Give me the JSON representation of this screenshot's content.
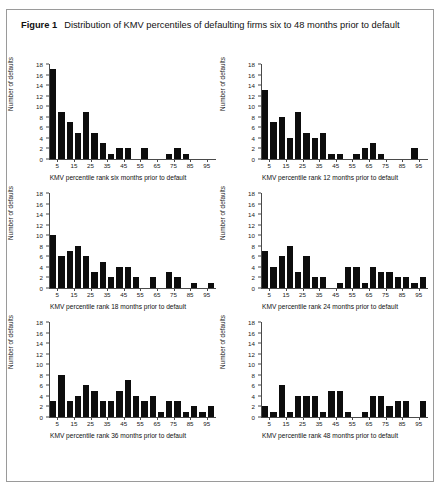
{
  "figure": {
    "label": "Figure 1",
    "title": "Distribution of KMV percentiles of defaulting firms six to 48 months prior to default"
  },
  "axis": {
    "ylabel": "Number of defaults",
    "yticks": [
      "0",
      "2",
      "4",
      "6",
      "8",
      "10",
      "12",
      "14",
      "16",
      "18"
    ],
    "xticks": [
      "5",
      "15",
      "25",
      "35",
      "45",
      "55",
      "65",
      "75",
      "85",
      "95"
    ]
  },
  "colors": {
    "bar": "#0d0d0d",
    "axis": "#4a4a4a",
    "border": "#9a9a9a",
    "background": "#ffffff"
  },
  "chart_data": [
    {
      "type": "bar",
      "title": "",
      "xlabel": "KMV percentile rank six months prior to default",
      "ylabel": "Number of defaults",
      "categories": [
        5,
        10,
        15,
        20,
        25,
        30,
        35,
        40,
        45,
        50,
        55,
        60,
        65,
        70,
        75,
        80,
        85,
        90,
        95,
        100
      ],
      "values": [
        17,
        9,
        7,
        5,
        9,
        5,
        3,
        1,
        2,
        2,
        0,
        2,
        0,
        0,
        1,
        2,
        1,
        0,
        0,
        0
      ],
      "ylim": [
        0,
        18
      ],
      "xlim": [
        0,
        100
      ],
      "grid": false
    },
    {
      "type": "bar",
      "title": "",
      "xlabel": "KMV percentile rank 12 months prior to default",
      "ylabel": "Number of defaults",
      "categories": [
        5,
        10,
        15,
        20,
        25,
        30,
        35,
        40,
        45,
        50,
        55,
        60,
        65,
        70,
        75,
        80,
        85,
        90,
        95,
        100
      ],
      "values": [
        13,
        7,
        8,
        4,
        9,
        5,
        4,
        5,
        1,
        1,
        0,
        1,
        2,
        3,
        1,
        0,
        0,
        0,
        2,
        0
      ],
      "ylim": [
        0,
        18
      ],
      "xlim": [
        0,
        100
      ],
      "grid": false
    },
    {
      "type": "bar",
      "title": "",
      "xlabel": "KMV percentile rank 18 months prior to default",
      "ylabel": "Number of defaults",
      "categories": [
        5,
        10,
        15,
        20,
        25,
        30,
        35,
        40,
        45,
        50,
        55,
        60,
        65,
        70,
        75,
        80,
        85,
        90,
        95,
        100
      ],
      "values": [
        10,
        6,
        7,
        8,
        6,
        3,
        5,
        2,
        4,
        4,
        2,
        0,
        2,
        0,
        3,
        2,
        0,
        1,
        0,
        1
      ],
      "ylim": [
        0,
        18
      ],
      "xlim": [
        0,
        100
      ],
      "grid": false
    },
    {
      "type": "bar",
      "title": "",
      "xlabel": "KMV percentile rank 24 months prior to default",
      "ylabel": "Number of defaults",
      "categories": [
        5,
        10,
        15,
        20,
        25,
        30,
        35,
        40,
        45,
        50,
        55,
        60,
        65,
        70,
        75,
        80,
        85,
        90,
        95,
        100
      ],
      "values": [
        7,
        4,
        6,
        8,
        3,
        6,
        2,
        2,
        0,
        1,
        4,
        4,
        1,
        4,
        3,
        3,
        2,
        2,
        1,
        2
      ],
      "ylim": [
        0,
        18
      ],
      "xlim": [
        0,
        100
      ],
      "grid": false
    },
    {
      "type": "bar",
      "title": "",
      "xlabel": "KMV percentile rank 36 months prior to default",
      "ylabel": "Number of defaults",
      "categories": [
        5,
        10,
        15,
        20,
        25,
        30,
        35,
        40,
        45,
        50,
        55,
        60,
        65,
        70,
        75,
        80,
        85,
        90,
        95,
        100
      ],
      "values": [
        3,
        8,
        3,
        4,
        6,
        5,
        3,
        3,
        5,
        7,
        4,
        3,
        4,
        1,
        3,
        3,
        1,
        2,
        1,
        2
      ],
      "ylim": [
        0,
        18
      ],
      "xlim": [
        0,
        100
      ],
      "grid": false
    },
    {
      "type": "bar",
      "title": "",
      "xlabel": "KMV percentile rank 48 months prior to default",
      "ylabel": "Number of defaults",
      "categories": [
        5,
        10,
        15,
        20,
        25,
        30,
        35,
        40,
        45,
        50,
        55,
        60,
        65,
        70,
        75,
        80,
        85,
        90,
        95,
        100
      ],
      "values": [
        2,
        1,
        6,
        1,
        4,
        4,
        4,
        1,
        5,
        5,
        1,
        0,
        1,
        4,
        4,
        2,
        3,
        3,
        0,
        3
      ],
      "ylim": [
        0,
        18
      ],
      "xlim": [
        0,
        100
      ],
      "grid": false
    }
  ]
}
